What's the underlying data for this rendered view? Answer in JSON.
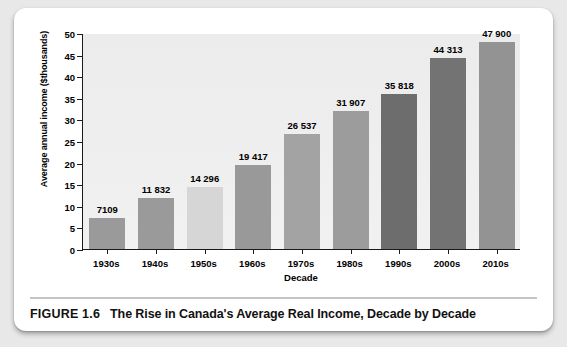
{
  "figure": {
    "caption_number": "FIGURE 1.6",
    "caption_title": "The Rise in Canada's Average Real Income, Decade by Decade"
  },
  "chart_data": {
    "type": "bar",
    "title": "",
    "xlabel": "Decade",
    "ylabel": "Average annual income ($thousands)",
    "categories": [
      "1930s",
      "1940s",
      "1950s",
      "1960s",
      "1970s",
      "1980s",
      "1990s",
      "2000s",
      "2010s"
    ],
    "values": [
      7109,
      11832,
      14296,
      19417,
      26537,
      31907,
      35818,
      44313,
      47900
    ],
    "value_labels": [
      "7109",
      "11 832",
      "14 296",
      "19 417",
      "26 537",
      "31 907",
      "35 818",
      "44 313",
      "47 900"
    ],
    "bar_colors": [
      "#9a9a9a",
      "#9a9a9a",
      "#d6d6d6",
      "#999999",
      "#a3a3a3",
      "#9c9c9c",
      "#6d6d6d",
      "#737373",
      "#939393"
    ],
    "ylim": [
      0,
      50
    ],
    "ytick_values": [
      0,
      5,
      10,
      15,
      20,
      25,
      30,
      35,
      40,
      45,
      50
    ],
    "ytick_labels": [
      "0",
      "5",
      "10",
      "15",
      "20",
      "25",
      "30",
      "35",
      "40",
      "45",
      "50"
    ],
    "grid": false,
    "legend": "none",
    "plot_background": "#eeeeee",
    "axis_color": "#1a1a1a"
  }
}
